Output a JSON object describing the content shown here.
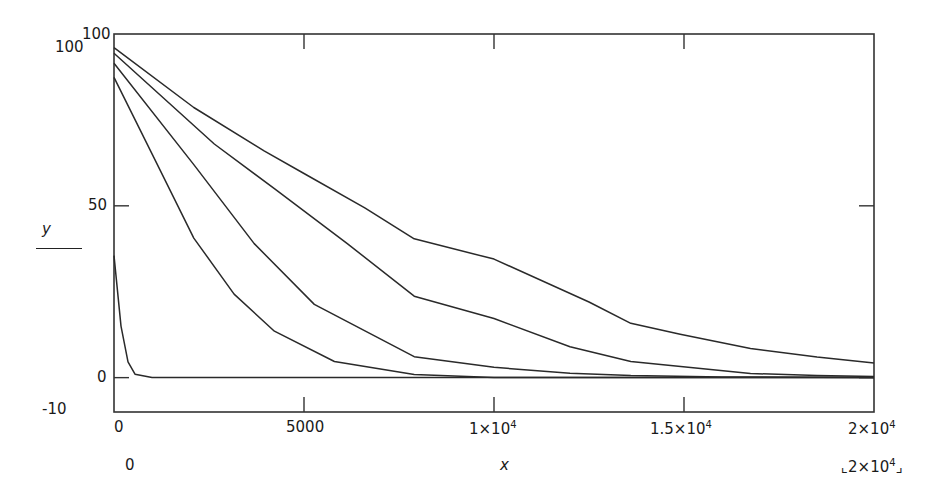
{
  "chart_data": {
    "type": "line",
    "title": "",
    "xlabel": "x",
    "ylabel": "y",
    "xlim": [
      0,
      20000
    ],
    "ylim": [
      -10,
      100
    ],
    "grid": false,
    "legend": null,
    "x_ticks": [
      0,
      5000,
      10000,
      15000,
      20000
    ],
    "x_tick_labels": [
      "0",
      "5000",
      "1×10⁴",
      "1.5×10⁴",
      "2×10⁴"
    ],
    "y_ticks": [
      0,
      50,
      100
    ],
    "y_tick_labels": [
      "0",
      "50",
      "100"
    ],
    "y_range_labels": {
      "upper": "100",
      "lower": "-10"
    },
    "x_range_labels": {
      "lower": "0",
      "upper": "⌞2×10⁴⌟"
    },
    "series": [
      {
        "name": "curve-1",
        "x": [
          0,
          2100,
          3950,
          5000,
          6600,
          7900,
          10000,
          12500,
          13600,
          14900,
          16750,
          18500,
          20000
        ],
        "y": [
          96,
          78.6,
          66,
          59.4,
          49.4,
          40.4,
          34.5,
          22,
          15.8,
          12.6,
          8.5,
          6,
          4.3
        ]
      },
      {
        "name": "curve-2",
        "x": [
          0,
          2640,
          4220,
          6140,
          7900,
          10000,
          12000,
          13600,
          16750,
          18500,
          20000
        ],
        "y": [
          94.4,
          68,
          55,
          39,
          23.7,
          17.2,
          9,
          4.7,
          1.2,
          0.6,
          0.3
        ]
      },
      {
        "name": "curve-3",
        "x": [
          0,
          2100,
          3690,
          5270,
          7900,
          10000,
          12000,
          13600,
          16000,
          20000
        ],
        "y": [
          91.5,
          62,
          39,
          21.3,
          6.1,
          3,
          1.3,
          0.6,
          0.2,
          0
        ]
      },
      {
        "name": "curve-4",
        "x": [
          0,
          1050,
          2100,
          3160,
          4220,
          5800,
          7900,
          10000,
          20000
        ],
        "y": [
          87.4,
          64,
          40.6,
          24.3,
          13.5,
          4.7,
          0.9,
          0,
          0
        ]
      },
      {
        "name": "curve-5",
        "x": [
          0,
          184,
          369,
          553,
          1000,
          20000
        ],
        "y": [
          35.5,
          15,
          4.6,
          1,
          0,
          0
        ]
      }
    ]
  },
  "labels": {
    "y_top_outer": "100",
    "y_top_inner": "100",
    "y_mid": "50",
    "y_zero": "0",
    "y_bottom_outer": "-10",
    "y_axis_name": "y",
    "x_0": "0",
    "x_5000": "5000",
    "x_1e4_mant": "1×10",
    "x_1e4_exp": "4",
    "x_15e3_mant": "1.5×10",
    "x_15e3_exp": "4",
    "x_2e4_mant": "2×10",
    "x_2e4_exp": "4",
    "x_axis_name": "x",
    "x_lower_outer": "0",
    "x_upper_outer_mant": "⌞2×10",
    "x_upper_outer_exp": "4",
    "x_upper_outer_close": "⌟"
  },
  "colors": {
    "line": "#2a2a2a",
    "axis": "#333333",
    "background": "#ffffff"
  }
}
